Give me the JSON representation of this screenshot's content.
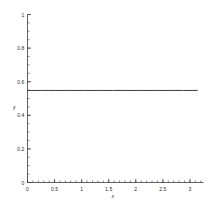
{
  "chart_data": {
    "type": "line",
    "title": "",
    "xlabel": "x",
    "ylabel": "y",
    "xlim": [
      0,
      3.25
    ],
    "ylim": [
      0,
      1
    ],
    "grid": false,
    "legend": null,
    "x_ticks": [
      {
        "value": 0,
        "label": "0"
      },
      {
        "value": 0.5,
        "label": "0.5"
      },
      {
        "value": 1,
        "label": "1"
      },
      {
        "value": 1.5,
        "label": "1.5"
      },
      {
        "value": 2,
        "label": "2"
      },
      {
        "value": 2.5,
        "label": "2.5"
      },
      {
        "value": 3,
        "label": "3"
      }
    ],
    "y_ticks": [
      {
        "value": 0,
        "label": "0"
      },
      {
        "value": 0.2,
        "label": "0.2"
      },
      {
        "value": 0.4,
        "label": "0.4"
      },
      {
        "value": 0.6,
        "label": "0.6"
      },
      {
        "value": 0.8,
        "label": "0.8"
      },
      {
        "value": 1,
        "label": "1"
      }
    ],
    "x_minor_step": 0.1,
    "y_minor_step": 0.05,
    "series": [
      {
        "name": "constant",
        "color": "#3c3c3c",
        "x": [
          0,
          0.2618,
          0.5236,
          0.7854,
          1.0472,
          1.309,
          1.5708,
          1.8326,
          2.0944,
          2.3562,
          2.618,
          2.8798,
          3.1416
        ],
        "values": [
          0.548,
          0.548,
          0.548,
          0.548,
          0.548,
          0.548,
          0.548,
          0.548,
          0.548,
          0.548,
          0.548,
          0.548,
          0.548
        ]
      }
    ]
  },
  "axis": {
    "x_name": "x",
    "y_name": "y"
  }
}
